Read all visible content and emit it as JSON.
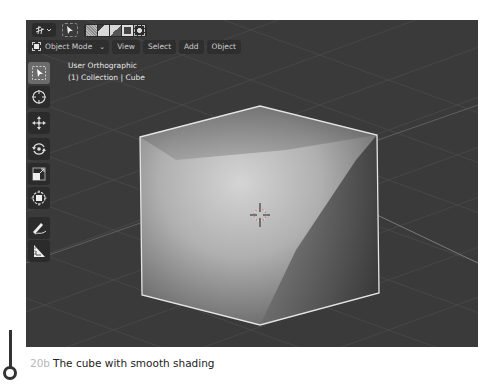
{
  "header": {
    "editor_type_icon": "grid-editor-icon",
    "select_tool_icon": "cursor-select-icon",
    "selection_mode_icons": [
      "select-new-icon",
      "select-extend-icon",
      "select-subtract-icon",
      "select-invert-icon",
      "select-intersect-icon"
    ],
    "mode_label": "Object Mode",
    "menus": [
      "View",
      "Select",
      "Add",
      "Object"
    ]
  },
  "viewport": {
    "view_name": "User Orthographic",
    "collection_info": "(1) Collection | Cube",
    "background_color": "#3a3a3a",
    "object": "Cube",
    "shading": "smooth",
    "outline_color": "#e0e0e0"
  },
  "toolbar": {
    "tools": [
      {
        "name": "select-box",
        "icon": "select-box-icon",
        "active": true
      },
      {
        "name": "cursor",
        "icon": "cursor-icon",
        "active": false
      },
      {
        "name": "move",
        "icon": "move-icon",
        "active": false
      },
      {
        "name": "rotate",
        "icon": "rotate-icon",
        "active": false
      },
      {
        "name": "scale",
        "icon": "scale-icon",
        "active": false
      },
      {
        "name": "transform",
        "icon": "transform-icon",
        "active": false
      },
      {
        "name": "annotate",
        "icon": "annotate-icon",
        "active": false
      },
      {
        "name": "measure",
        "icon": "measure-icon",
        "active": false
      }
    ]
  },
  "caption": {
    "figure_number": "20b",
    "text": "The cube with smooth shading"
  }
}
